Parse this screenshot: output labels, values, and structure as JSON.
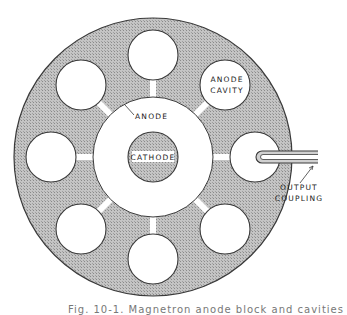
{
  "figure": {
    "labels": {
      "anode_cavity_line1": "ANODE",
      "anode_cavity_line2": "CAVITY",
      "anode": "ANODE",
      "cathode": "CATHODE",
      "output_coupling_line1": "OUTPUT",
      "output_coupling_line2": "COUPLING"
    },
    "caption": "Fig. 10-1. Magnetron anode block and cavities",
    "colors": {
      "block_fill": "#b9b9b9",
      "outline": "#3a3a3a",
      "background": "#ffffff"
    },
    "geometry": {
      "block_center": [
        153,
        157
      ],
      "block_radius": 139,
      "bore_radius": 60,
      "cathode_radius": 25,
      "cavity_count": 8,
      "cavity_radius": 25,
      "cavity_orbit_radius": 102
    }
  }
}
